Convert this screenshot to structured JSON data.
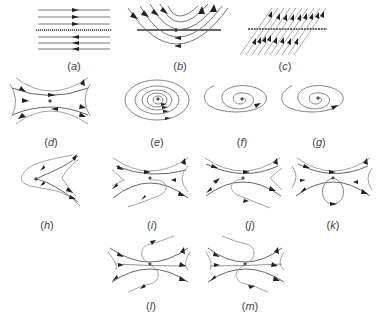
{
  "figure": {
    "panels": [
      {
        "id": "a",
        "label": "a",
        "type": "parallel-flow-line-of-equilibria"
      },
      {
        "id": "b",
        "label": "b",
        "type": "parabolic-flow-over-line"
      },
      {
        "id": "c",
        "label": "c",
        "type": "shear-flow-through-line"
      },
      {
        "id": "d",
        "label": "d",
        "type": "saddle"
      },
      {
        "id": "e",
        "label": "e",
        "type": "nested-closed-orbits-center"
      },
      {
        "id": "f",
        "label": "f",
        "type": "spiral-focus"
      },
      {
        "id": "g",
        "label": "g",
        "type": "spiral-focus"
      },
      {
        "id": "h",
        "label": "h",
        "type": "cusp"
      },
      {
        "id": "i",
        "label": "i",
        "type": "saddle-with-homoclinic-loop"
      },
      {
        "id": "j",
        "label": "j",
        "type": "saddle-with-homoclinic-loop"
      },
      {
        "id": "k",
        "label": "k",
        "type": "saddle-with-homoclinic-loop"
      },
      {
        "id": "l",
        "label": "l",
        "type": "double-loop-saddle"
      },
      {
        "id": "m",
        "label": "m",
        "type": "double-loop-saddle"
      }
    ]
  },
  "labels": {
    "a": "a",
    "b": "b",
    "c": "c",
    "d": "d",
    "e": "e",
    "f": "f",
    "g": "g",
    "h": "h",
    "i": "i",
    "j": "j",
    "k": "k",
    "l": "l",
    "m": "m"
  },
  "colors": {
    "stroke": "#555555",
    "light_stroke": "#8a8a8a",
    "arrow": "#222222",
    "label": "#444444",
    "background": "#ffffff"
  }
}
